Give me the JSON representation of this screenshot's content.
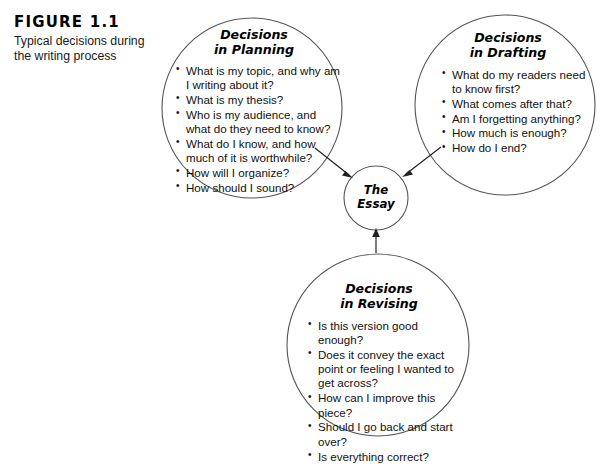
{
  "figure": {
    "number": "FIGURE 1.1",
    "caption": "Typical decisions during the writing process"
  },
  "diagram": {
    "type": "cycle-diagram",
    "center": {
      "label": "The\nEssay"
    },
    "nodes": [
      {
        "id": "planning",
        "title": "Decisions\nin Planning",
        "items": [
          "What is my topic, and why am I writing about it?",
          "What is my thesis?",
          "Who is my audience, and what do they need to know?",
          "What do I know, and how much of it is worthwhile?",
          "How will I organize?",
          "How should I sound?"
        ]
      },
      {
        "id": "drafting",
        "title": "Decisions\nin Drafting",
        "items": [
          "What do my readers need to know first?",
          "What comes after that?",
          "Am I forgetting anything?",
          "How much is enough?",
          "How do I end?"
        ]
      },
      {
        "id": "revising",
        "title": "Decisions\nin Revising",
        "items": [
          "Is this version good enough?",
          "Does it convey the exact point or feeling I wanted to get across?",
          "How can I improve this piece?",
          "Should I go back and start over?",
          "Is everything correct?"
        ]
      }
    ],
    "arrows": [
      {
        "from": "planning",
        "to": "center"
      },
      {
        "from": "drafting",
        "to": "center"
      },
      {
        "from": "revising",
        "to": "center"
      }
    ],
    "colors": {
      "stroke": "#555555",
      "arrow": "#222222",
      "text": "#111111",
      "background": "#ffffff"
    }
  }
}
